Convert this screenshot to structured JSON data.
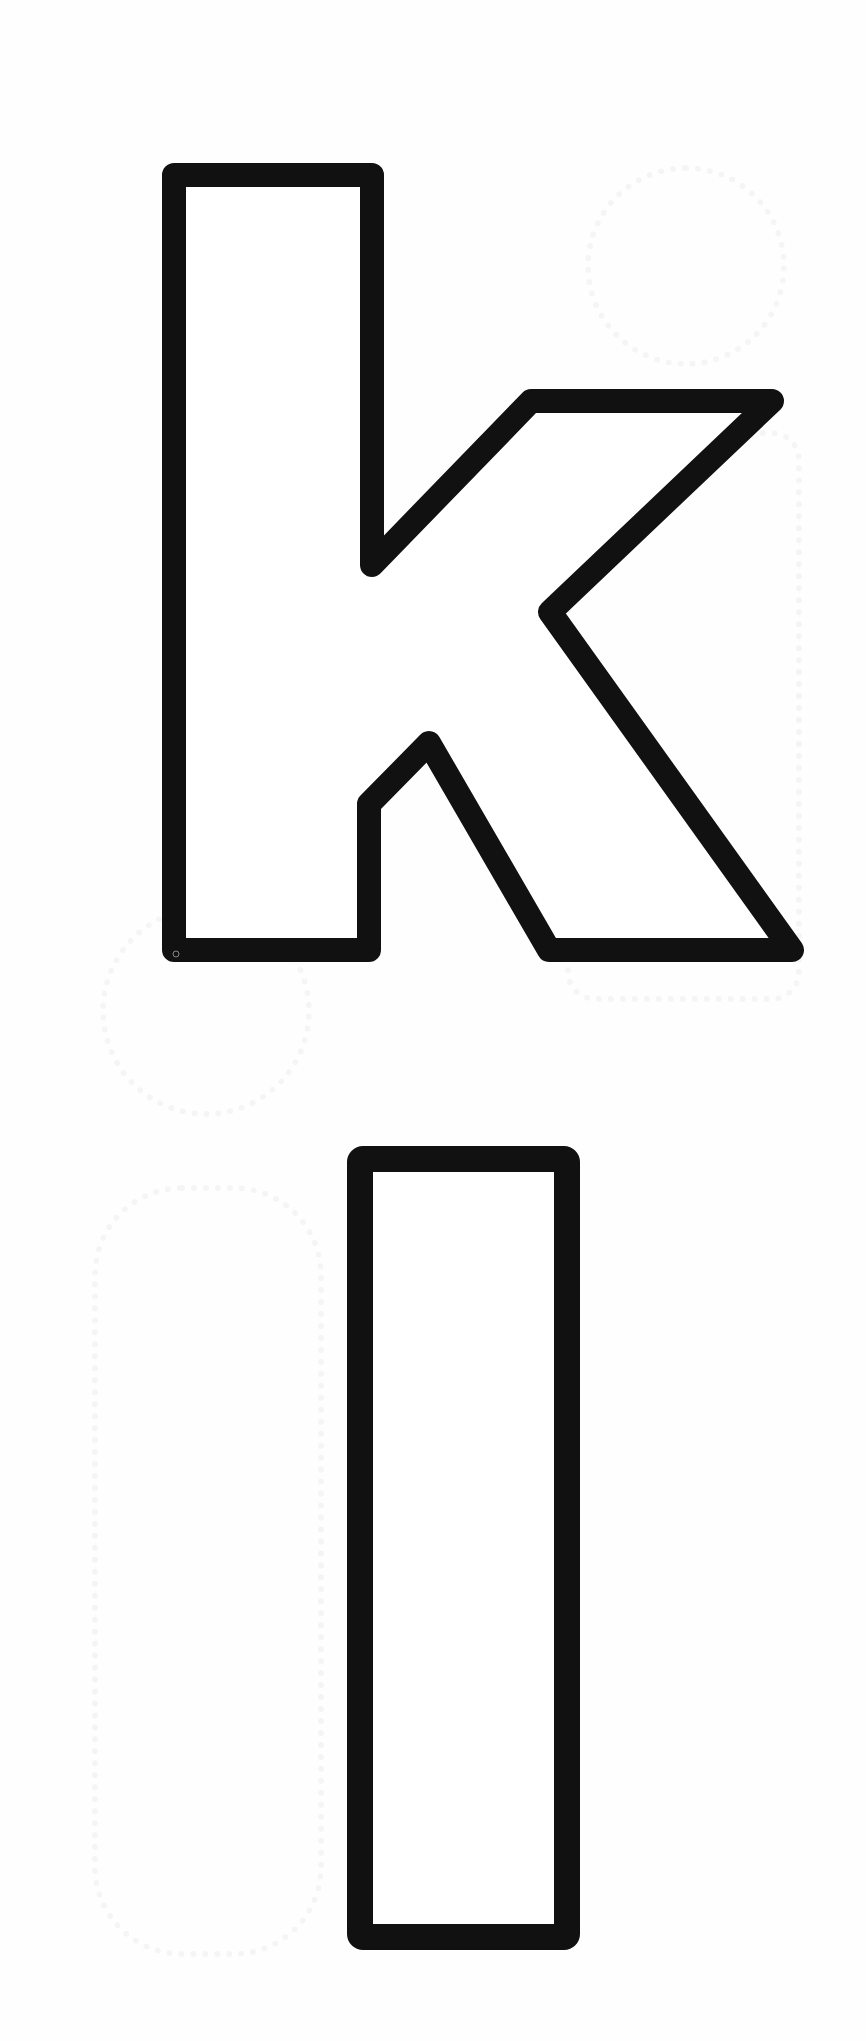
{
  "document": {
    "type": "letter-outline-worksheet",
    "letters": [
      {
        "char": "k",
        "case": "lowercase",
        "style": "outline",
        "stroke_color": "#111111",
        "fill_color": "#ffffff"
      },
      {
        "char": "l",
        "case": "lowercase",
        "style": "outline",
        "stroke_color": "#111111",
        "fill_color": "#ffffff"
      }
    ],
    "background_color": "#fefefe"
  }
}
